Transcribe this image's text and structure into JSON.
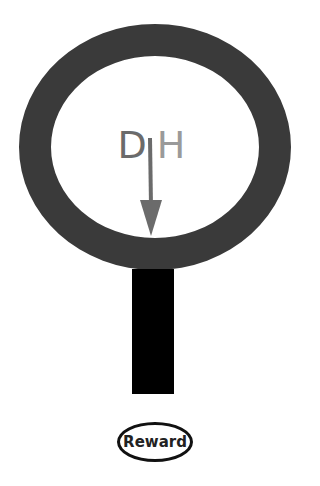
{
  "diagram": {
    "label_d": "D",
    "label_h": "H",
    "reward_label": "Reward",
    "colors": {
      "ring": "#3a3a3a",
      "stem": "#000000",
      "arrow": "#6b6b6b",
      "letter_d": "#6b6b6b",
      "letter_h": "#9a9a9a"
    },
    "icons": [
      "ring-shape",
      "down-arrow-icon",
      "stem-bar",
      "reward-ellipse"
    ]
  }
}
